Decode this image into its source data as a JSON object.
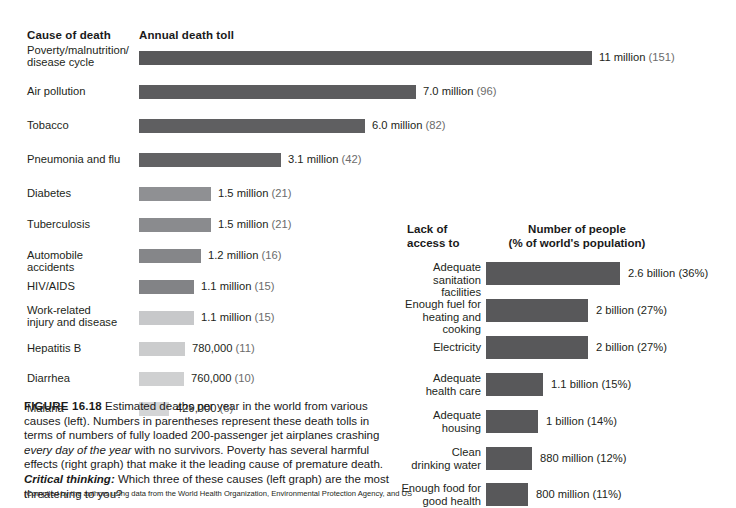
{
  "figure": {
    "number_label": "FIGURE 16.18",
    "caption_part1": " Estimated deaths per year in the world from various causes (left). Numbers in parentheses represent these death tolls in terms of numbers of fully loaded 200-passenger jet airplanes crashing ",
    "caption_italic": "every day of the year",
    "caption_part2": " with no survivors. Poverty has several harmful effects (right graph) that make it the leading cause of premature death. ",
    "critical_thinking_label": "Critical thinking:",
    "critical_thinking_text": " Which three of these causes (left graph) are the most threatening to you?",
    "credit": "(Compiled by the authors using data from the World Health Organization, Environmental Protection Agency, and US"
  },
  "chart_data": [
    {
      "type": "bar",
      "orientation": "horizontal",
      "id": "annual-death-toll",
      "title": "Annual death toll",
      "category_header": "Cause of death",
      "xlabel": "",
      "ylabel": "",
      "grid": false,
      "units": "deaths per year",
      "categories": [
        "Poverty/malnutrition/\ndisease cycle",
        "Air pollution",
        "Tobacco",
        "Pneumonia and flu",
        "Diabetes",
        "Tuberculosis",
        "Automobile accidents",
        "HIV/AIDS",
        "Work-related\ninjury and disease",
        "Hepatitis B",
        "Diarrhea",
        "Malaria"
      ],
      "values": [
        11000000,
        7000000,
        6000000,
        3100000,
        1500000,
        1500000,
        1200000,
        1100000,
        1100000,
        780000,
        760000,
        429000
      ],
      "value_labels": [
        "11 million",
        "7.0 million",
        "6.0  million",
        "3.1 million",
        "1.5 million",
        "1.5 million",
        "1.2 million",
        "1.1 million",
        "1.1 million",
        "780,000",
        "760,000",
        "429,000"
      ],
      "paren_labels": [
        "(151)",
        "(96)",
        "(82)",
        "(42)",
        "(21)",
        "(21)",
        "(16)",
        "(15)",
        "(15)",
        "(11)",
        "(10)",
        "(6)"
      ],
      "paren_meaning": "number of fully loaded 200-passenger jet airplanes crashing every day of the year",
      "bar_colors": [
        "#58585a",
        "#5c5c5e",
        "#5f5f61",
        "#626264",
        "#8f9093",
        "#8a8b8e",
        "#858689",
        "#828386",
        "#c7c8ca",
        "#cbcccd",
        "#cfd0d1",
        "#d4d5d6"
      ],
      "bar_widths_px": [
        453,
        277,
        226,
        142,
        72,
        72,
        62,
        55,
        55,
        46,
        45,
        30
      ],
      "rows_top_px": [
        52,
        86,
        120,
        154,
        188,
        219,
        250,
        281,
        312,
        343,
        373,
        403
      ]
    },
    {
      "type": "bar",
      "orientation": "horizontal",
      "id": "lack-of-access",
      "title": "Number of people\n(% of world's population)",
      "category_header": "Lack of\naccess to",
      "xlabel": "",
      "ylabel": "",
      "grid": false,
      "units": "people",
      "categories": [
        "Adequate\nsanitation facilities",
        "Enough fuel for\nheating and cooking",
        "Electricity",
        "Adequate\nhealth care",
        "Adequate\nhousing",
        "Clean\ndrinking water",
        "Enough food for\ngood health"
      ],
      "values": [
        2600000000,
        2000000000,
        2000000000,
        1100000000,
        1000000000,
        880000000,
        800000000
      ],
      "percents": [
        36,
        27,
        27,
        15,
        14,
        12,
        11
      ],
      "value_labels": [
        "2.6 billion (36%)",
        "2 billion (27%)",
        "2 billion (27%)",
        "1.1 billion (15%)",
        "1 billion (14%)",
        "880 million (12%)",
        "800 million (11%)"
      ],
      "bar_color": "#58585a",
      "bar_widths_px": [
        134,
        102,
        102,
        57,
        52,
        46,
        42
      ],
      "rows_top_px": [
        47,
        84,
        121,
        158,
        195,
        232,
        268
      ]
    }
  ]
}
